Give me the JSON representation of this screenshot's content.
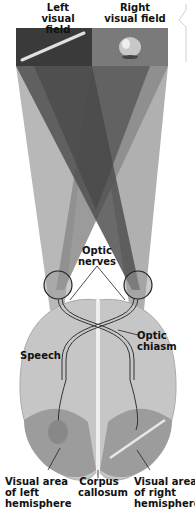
{
  "diagram": {
    "fields": {
      "left": {
        "label": "Left\nvisual field",
        "object": "pencil",
        "color": "#3a3a3a"
      },
      "right": {
        "label": "Right\nvisual field",
        "object": "apple",
        "color": "#7a7a7a"
      }
    },
    "labels": {
      "optic_nerves": "Optic\nnerves",
      "optic_chiasm": "Optic\nchiasm",
      "speech": "Speech",
      "visual_area_left": "Visual area\nof left\nhemisphere",
      "corpus_callosum": "Corpus\ncallosum",
      "visual_area_right": "Visual area\nof right\nhemisphere"
    },
    "colors": {
      "brain": "#c8c8c8",
      "brain_dark": "#9a9a9a",
      "cone_dark": "#4a4a4a",
      "cone_mid": "#8a8a8a",
      "cone_light": "#b5b5b5"
    }
  }
}
